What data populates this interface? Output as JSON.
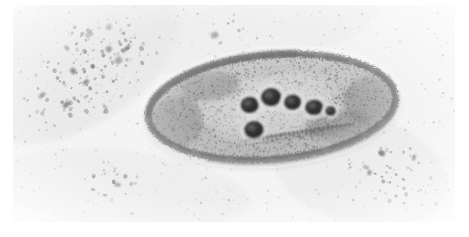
{
  "image": {
    "kind": "transmission-electron-micrograph",
    "subject": "rod-shaped bacterium (bacillus) in thin section",
    "orientation": "horizontal, long axis left-to-right, tilted slightly",
    "canvas": {
      "width": 469,
      "height": 237
    },
    "plate": {
      "x": 13,
      "y": 5,
      "width": 442,
      "height": 217
    },
    "background_color": "#f3f3f3",
    "border_color": "#ffffff",
    "tone": {
      "lightest": "#fbfbfb",
      "midtone": "#bdbdbd",
      "darkest": "#3a3a3a"
    },
    "has_scale_bar": false,
    "has_caption_text": false,
    "has_labels": false
  },
  "cell": {
    "name": "bacterial-cell",
    "shape": "ellipse",
    "center": {
      "x": 272,
      "y": 107
    },
    "radius_x": 124,
    "radius_y": 52,
    "rotation_deg": -5,
    "envelope_color": "#4a4a4a",
    "envelope_thickness": 7,
    "cytoplasm_color": "#b9b9b9",
    "left_tip_x": 150,
    "right_tip_x": 396,
    "top_y": 55,
    "bottom_y": 160
  },
  "granules": {
    "label": "electron-dense granules",
    "count": 6,
    "fill_color": "#2e2e2e",
    "items": [
      {
        "id": "granule-1",
        "cx": 250,
        "cy": 103,
        "rx": 9,
        "ry": 8
      },
      {
        "id": "granule-2",
        "cx": 272,
        "cy": 97,
        "rx": 10,
        "ry": 9
      },
      {
        "id": "granule-3",
        "cx": 293,
        "cy": 104,
        "rx": 8.5,
        "ry": 7.5
      },
      {
        "id": "granule-4",
        "cx": 314,
        "cy": 111,
        "rx": 9,
        "ry": 7.5
      },
      {
        "id": "granule-5",
        "cx": 252,
        "cy": 128,
        "rx": 9.5,
        "ry": 8.5
      },
      {
        "id": "granule-6",
        "cx": 330,
        "cy": 116,
        "rx": 5,
        "ry": 4.5
      }
    ]
  },
  "septum": {
    "label": "internal-septum-line",
    "x1": 243,
    "y1": 138,
    "x2": 352,
    "y2": 131,
    "color": "#5a5a5a",
    "thickness": 2
  },
  "debris": {
    "label": "background-stain-debris",
    "clusters": [
      {
        "id": "debris-upper-left-band",
        "cx": 86,
        "cy": 72,
        "rx": 72,
        "ry": 44,
        "rot": -38,
        "density": 0.55
      },
      {
        "id": "debris-lower-right",
        "cx": 398,
        "cy": 176,
        "rx": 52,
        "ry": 30,
        "rot": 18,
        "density": 0.42
      },
      {
        "id": "debris-top-center",
        "cx": 214,
        "cy": 34,
        "rx": 34,
        "ry": 14,
        "rot": -20,
        "density": 0.22
      },
      {
        "id": "debris-lower-left",
        "cx": 120,
        "cy": 186,
        "rx": 46,
        "ry": 18,
        "rot": 8,
        "density": 0.25
      }
    ]
  }
}
